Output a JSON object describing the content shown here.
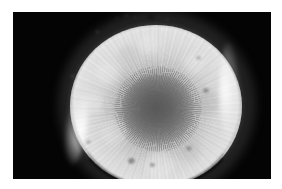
{
  "image": {
    "title": "Petri dish fungal colony",
    "subject": "filamentous fungal colony cultured on agar in a Petri dish",
    "capture_style": "grayscale macro photograph, top-down view",
    "alt_text": "Grayscale photograph of a round Petri dish containing a dense whitish-grey filamentous fungal colony with a darker radially textured sporulating centre, set against a black background with a thin white page margin.",
    "layout": {
      "canvas_width": 282,
      "canvas_height": 189,
      "margin_color": "#ffffff",
      "photo": {
        "left": 13,
        "top": 12,
        "width": 258,
        "height": 167
      }
    },
    "colors": {
      "page_margin": "#ffffff",
      "photo_background": "#040404",
      "colony_outer_white": "#efefef",
      "colony_mid_grey": "#d2d2d2",
      "colony_inner_grey": "#8c8c8c",
      "sporulating_centre": "#6a6a6a",
      "dish_rim_highlight": "#ffffff",
      "dish_wall_shadow": "#080808",
      "droplet_dark": "#2a2a2a"
    },
    "regions": [
      {
        "name": "photo-background",
        "description": "uniform black field surrounding the dish"
      },
      {
        "name": "dish-rim",
        "description": "bright circular rim of the Petri dish wall"
      },
      {
        "name": "colony-margin",
        "description": "pale white advancing edge of mycelium"
      },
      {
        "name": "colony-mid",
        "description": "light grey zone with radial hyphal striations"
      },
      {
        "name": "sporulating-centre",
        "description": "darker grey granular centre of the colony"
      }
    ],
    "geometry": {
      "dish_center_x": 143,
      "dish_center_y": 94,
      "dish_radius_x": 86,
      "dish_radius_y": 81,
      "colony_center_x": 144,
      "colony_center_y": 97,
      "centre_radius_x": 36,
      "centre_radius_y": 35
    },
    "droplets": [
      {
        "name": "droplet-top-1",
        "left": 114,
        "top": 17,
        "size": 6,
        "shade": "rgba(25,25,25,0.80)"
      },
      {
        "name": "droplet-top-2",
        "left": 124,
        "top": 14,
        "size": 5,
        "shade": "rgba(35,35,35,0.72)"
      },
      {
        "name": "droplet-top-3",
        "left": 133,
        "top": 16,
        "size": 4,
        "shade": "rgba(40,40,40,0.65)"
      },
      {
        "name": "droplet-top-4",
        "left": 147,
        "top": 13,
        "size": 8,
        "shade": "rgba(22,22,22,0.85)"
      },
      {
        "name": "droplet-top-5",
        "left": 165,
        "top": 18,
        "size": 5,
        "shade": "rgba(45,45,45,0.60)"
      },
      {
        "name": "droplet-upper-left",
        "left": 95,
        "top": 30,
        "size": 5,
        "shade": "rgba(60,60,60,0.45)"
      },
      {
        "name": "droplet-left-edge",
        "left": 70,
        "top": 74,
        "size": 6,
        "shade": "rgba(70,70,70,0.38)"
      },
      {
        "name": "droplet-right-edge",
        "left": 203,
        "top": 88,
        "size": 6,
        "shade": "rgba(70,70,70,0.40)"
      },
      {
        "name": "droplet-right-upper",
        "left": 196,
        "top": 56,
        "size": 5,
        "shade": "rgba(80,80,80,0.32)"
      },
      {
        "name": "droplet-bottom-1",
        "left": 128,
        "top": 158,
        "size": 7,
        "shade": "rgba(60,60,60,0.45)"
      },
      {
        "name": "droplet-bottom-2",
        "left": 150,
        "top": 163,
        "size": 5,
        "shade": "rgba(55,55,55,0.42)"
      },
      {
        "name": "droplet-bottom-3",
        "left": 186,
        "top": 146,
        "size": 6,
        "shade": "rgba(72,72,72,0.35)"
      },
      {
        "name": "droplet-lower-left",
        "left": 86,
        "top": 140,
        "size": 5,
        "shade": "rgba(80,80,80,0.30)"
      }
    ]
  }
}
